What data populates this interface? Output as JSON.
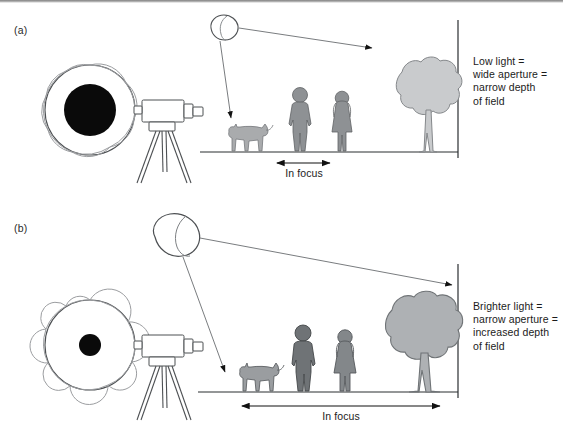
{
  "figure": {
    "panels": [
      {
        "id": "a",
        "label": "(a)",
        "caption": "Low light =\nwide aperture =\nnarrow depth\nof field",
        "focus_label": "In focus",
        "aperture": {
          "name": "wide-aperture",
          "opening": "wide",
          "opening_radius_px": 26,
          "blade_count": 9
        },
        "light_source": {
          "name": "small-light-source",
          "size": "small",
          "brightness": "low"
        },
        "subjects": [
          {
            "name": "dog",
            "fill": "#a9abad",
            "in_focus": false
          },
          {
            "name": "man",
            "fill": "#8e9194",
            "in_focus": true
          },
          {
            "name": "woman",
            "fill": "#8e9194",
            "in_focus": true
          },
          {
            "name": "tree",
            "fill": "#c9cbcd",
            "in_focus": false
          }
        ],
        "focus_band": {
          "start_px": 275,
          "end_px": 330,
          "width_px": 55
        }
      },
      {
        "id": "b",
        "label": "(b)",
        "caption": "Brighter light =\nnarrow aperture =\nincreased depth\nof field",
        "focus_label": "In focus",
        "aperture": {
          "name": "narrow-aperture",
          "opening": "narrow",
          "opening_radius_px": 11,
          "blade_count": 9
        },
        "light_source": {
          "name": "large-light-source",
          "size": "large",
          "brightness": "high"
        },
        "subjects": [
          {
            "name": "dog",
            "fill": "#9a9da0",
            "in_focus": true
          },
          {
            "name": "man",
            "fill": "#6f7376",
            "in_focus": true
          },
          {
            "name": "woman",
            "fill": "#83878a",
            "in_focus": true
          },
          {
            "name": "tree",
            "fill": "#aeb1b4",
            "in_focus": true
          }
        ],
        "focus_band": {
          "start_px": 240,
          "end_px": 440,
          "width_px": 200
        }
      }
    ],
    "camera": {
      "name": "camera-on-tripod",
      "count": 2
    },
    "colors": {
      "ink": "#1b1b1b",
      "line": "#5c5f62",
      "aperture_opening": "#0a0a0a",
      "blade_stroke": "#8b8d90",
      "subject_light": "#c9cbcd",
      "subject_dark": "#6f7376",
      "background": "#ffffff"
    }
  }
}
